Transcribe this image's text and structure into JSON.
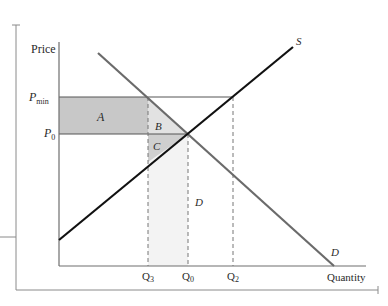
{
  "diagram": {
    "axes": {
      "y_label": "Price",
      "x_label": "Quantity"
    },
    "price_levels": [
      {
        "id": "pmin",
        "label_main": "P",
        "label_sub": "min"
      },
      {
        "id": "p0",
        "label_main": "P",
        "label_sub": "0"
      }
    ],
    "quantity_levels": [
      {
        "id": "q3",
        "label_main": "Q",
        "label_sub": "3"
      },
      {
        "id": "q0",
        "label_main": "Q",
        "label_sub": "0"
      },
      {
        "id": "q2",
        "label_main": "Q",
        "label_sub": "2"
      }
    ],
    "curves": {
      "supply_label": "S",
      "demand_label": "D"
    },
    "areas": {
      "a": "A",
      "b": "B",
      "c": "C",
      "d": "D"
    },
    "colors": {
      "axis": "#6e6e6e",
      "supply": "#111111",
      "demand": "#6b6b6b",
      "area_a": "#c8c8c8",
      "area_b": "#e2e2e2",
      "area_c": "#cfcfcf",
      "area_d": "#f3f3f3",
      "guide": "#777777"
    }
  }
}
